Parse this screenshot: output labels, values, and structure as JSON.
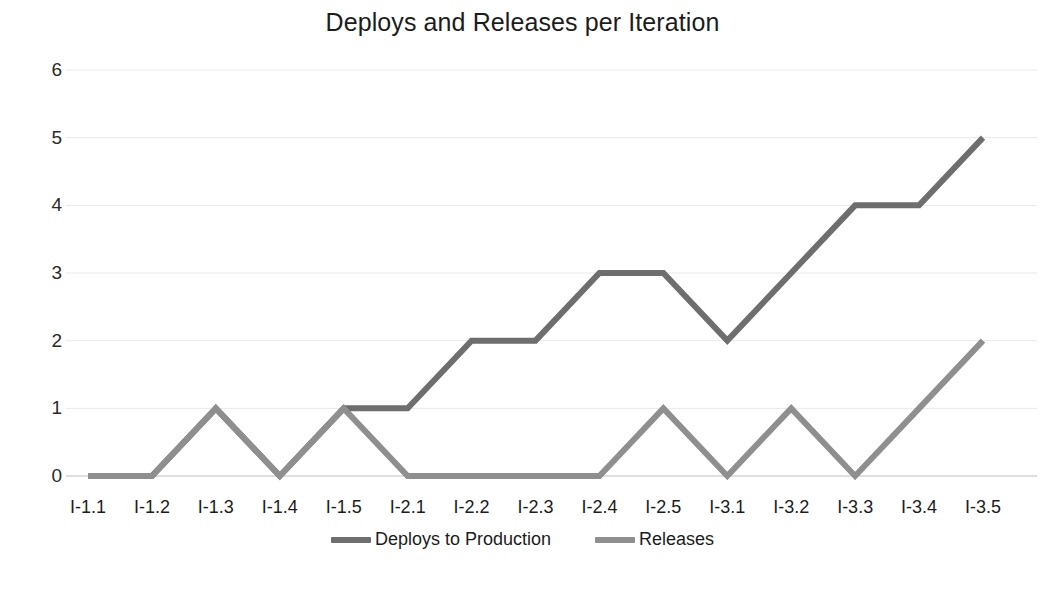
{
  "chart_data": {
    "type": "line",
    "title": "Deploys and Releases per Iteration",
    "xlabel": "",
    "ylabel": "",
    "ylim": [
      0,
      6
    ],
    "yticks": [
      0,
      1,
      2,
      3,
      4,
      5,
      6
    ],
    "grid": true,
    "legend_position": "bottom",
    "categories": [
      "I-1.1",
      "I-1.2",
      "I-1.3",
      "I-1.4",
      "I-1.5",
      "I-2.1",
      "I-2.2",
      "I-2.3",
      "I-2.4",
      "I-2.5",
      "I-3.1",
      "I-3.2",
      "I-3.3",
      "I-3.4",
      "I-3.5"
    ],
    "series": [
      {
        "name": "Deploys to Production",
        "color": "#6e6e6e",
        "values": [
          0,
          0,
          1,
          0,
          1,
          1,
          2,
          2,
          3,
          3,
          2,
          3,
          4,
          4,
          5
        ]
      },
      {
        "name": "Releases",
        "color": "#8f8f8f",
        "values": [
          0,
          0,
          1,
          0,
          1,
          0,
          0,
          0,
          0,
          1,
          0,
          1,
          0,
          1,
          2
        ]
      }
    ]
  },
  "colors": {
    "background": "#ffffff",
    "grid": "#e9e9e9",
    "axis": "#d5d5d5",
    "text": "#1c1c1c"
  },
  "legend": {
    "items": [
      {
        "label": "Deploys to Production",
        "color": "#6e6e6e"
      },
      {
        "label": "Releases",
        "color": "#8f8f8f"
      }
    ]
  }
}
